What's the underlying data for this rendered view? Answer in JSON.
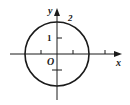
{
  "diagram": {
    "type": "coordinate-plane-circle",
    "axes": {
      "x_label": "x",
      "y_label": "y",
      "origin_label": "O"
    },
    "circle": {
      "center": [
        0,
        0
      ],
      "radius": 2,
      "radius_label": "2"
    },
    "tick_labels": {
      "y_one": "1"
    },
    "ticks": {
      "x": [
        -1,
        1,
        3
      ],
      "y": [
        1,
        -1
      ]
    },
    "colors": {
      "stroke": "#1a1a1a",
      "background": "#ffffff"
    }
  }
}
